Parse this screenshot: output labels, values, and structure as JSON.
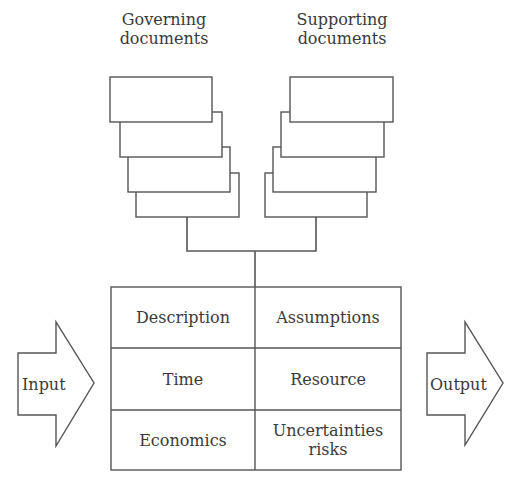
{
  "diagram": {
    "governing": {
      "title": "Governing documents",
      "line1": "Governing",
      "line2": "documents"
    },
    "supporting": {
      "title": "Supporting documents",
      "line1": "Supporting",
      "line2": "documents"
    },
    "table": {
      "cells": [
        [
          "Description",
          "Assumptions"
        ],
        [
          "Time",
          "Resource"
        ],
        [
          "Economics",
          "Uncertainties risks"
        ]
      ],
      "uncertainties_line1": "Uncertainties",
      "uncertainties_line2": "risks"
    },
    "input_label": "Input",
    "output_label": "Output",
    "colors": {
      "stroke": "#555555",
      "text": "#3a3a3a",
      "background": "#ffffff"
    }
  }
}
